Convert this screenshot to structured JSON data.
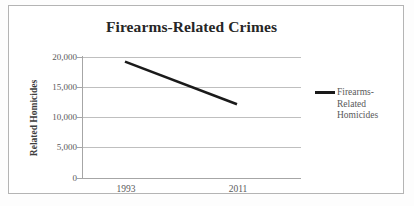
{
  "chart_data": {
    "type": "line",
    "title": "Firearms-Related Crimes",
    "xlabel": "",
    "ylabel": "Related Homicides",
    "categories": [
      "1993",
      "2011"
    ],
    "x": [
      1993,
      2011
    ],
    "series": [
      {
        "name": "Firearms-Related Homicides",
        "values": [
          18250,
          11200
        ]
      }
    ],
    "ylim": [
      0,
      20000
    ],
    "ytick_labels": [
      "20,000",
      "15,000",
      "10,000",
      "5,000",
      "0"
    ],
    "ytick_values": [
      20000,
      15000,
      10000,
      5000,
      0
    ],
    "grid": true,
    "legend_position": "right",
    "legend_entries": [
      {
        "label": "Firearms-Related Homicides",
        "label_lines": [
          "Firearms-",
          "Related",
          "Homicides"
        ],
        "color": "#1a1a1a"
      }
    ],
    "colors": {
      "series_line": "#1a1a1a",
      "gridline": "#bfbfbf",
      "axis": "#a6a6a6",
      "title_text": "#262626",
      "tick_text": "#5a5a5a",
      "axis_title_text": "#3d3d3d",
      "legend_text": "#595959",
      "frame_border": "#b4b4b4",
      "plot_background": "#ffffff"
    }
  }
}
